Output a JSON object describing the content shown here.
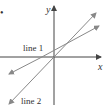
{
  "figure": {
    "bullet": "•",
    "axes": {
      "x_label": "x",
      "y_label": "y"
    },
    "lines": [
      {
        "name": "line 1",
        "label": "line 1",
        "slope_description": "shallower, positive y-intercept"
      },
      {
        "name": "line 2",
        "label": "line 2",
        "slope_description": "steeper, passes near origin"
      }
    ],
    "colors": {
      "axis": "#444444",
      "line": "#888888",
      "text": "#333333"
    }
  }
}
